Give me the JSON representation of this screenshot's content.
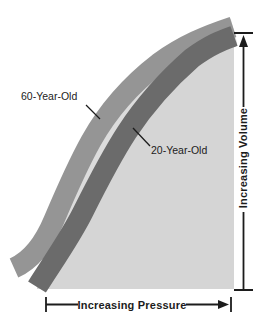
{
  "labels": {
    "curve_60": "60-Year-Old",
    "curve_20": "20-Year-Old",
    "pressure_axis": "Increasing Pressure",
    "volume_axis": "Increasing Volume"
  },
  "colors": {
    "background": "#ffffff",
    "band_60": "#959595",
    "band_20": "#6b6b6b",
    "under_curve_fill": "#d5d5d5",
    "band_gap": "#dcdcdc",
    "ink": "#1c1c1c"
  },
  "geometry": {
    "gap_sliver": "M43 260 C55 238 62 228 68 216 C80 190 95 162 109 136 C128 104 150 78 175 60 C200 43 215 36 234 31",
    "fill_area": "M37 287 C54 260 70 238 83 212 C96 186 110 158 127 132 C146 103 168 79 192 58 C211 44 223 40 234 36 L234 289 L37 289 Z",
    "band_60": "M14 268 C32 260 44 244 54 220 C65 194 76 168 91 141 C110 107 133 83 159 63 C184 45 206 36 233 27",
    "band_20": "M37 287 C54 260 70 238 83 212 C96 186 110 158 127 132 C146 103 168 79 192 58 C211 44 223 40 234 36",
    "pointer_60": "M86 105 L100 119",
    "pointer_20": "M150 146 L133 128",
    "volume_axis_lines": "M234 33 H253 M243.5 45 V107 M243.5 212 V290 M234 290 H253",
    "volume_arrowhead": "M243.5 35 L239 47 L248 47 Z",
    "pressure_axis_lines": "M46 297 V312 M46 304.5 H78 M186 304.5 H219 M231 297 V312",
    "pressure_arrowhead": "M229 304.5 L218 300 L218 309 Z"
  },
  "chart_data": {
    "type": "area",
    "title": "",
    "xlabel": "Increasing Pressure",
    "ylabel": "Increasing Volume",
    "axes_qualitative": true,
    "grid": false,
    "legend_position": "inline-labels",
    "x_range_normalized": [
      0,
      1
    ],
    "y_range_normalized": [
      0,
      1
    ],
    "series": [
      {
        "name": "60-Year-Old",
        "color": "#959595",
        "style": "thick-band",
        "points_normalized": [
          [
            0,
            0.09
          ],
          [
            0.04,
            0.27
          ],
          [
            0.24,
            0.58
          ],
          [
            0.43,
            0.73
          ],
          [
            0.61,
            0.88
          ],
          [
            1.0,
            1.0
          ]
        ]
      },
      {
        "name": "20-Year-Old",
        "color": "#6b6b6b",
        "style": "thick-band",
        "points_normalized": [
          [
            0,
            0.01
          ],
          [
            0.2,
            0.3
          ],
          [
            0.44,
            0.61
          ],
          [
            0.56,
            0.74
          ],
          [
            0.79,
            0.9
          ],
          [
            1.0,
            0.99
          ]
        ]
      }
    ],
    "annotations": [
      {
        "text": "60-Year-Old",
        "points_to": "upper-left band via leader line"
      },
      {
        "text": "20-Year-Old",
        "points_to": "lower-right band via leader line"
      }
    ]
  }
}
